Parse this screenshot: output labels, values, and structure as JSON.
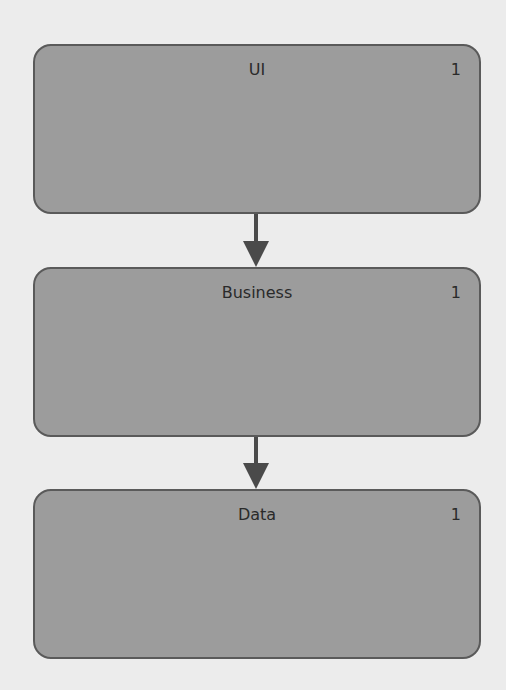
{
  "diagram": {
    "type": "layered-architecture",
    "colors": {
      "background": "#ececec",
      "box_fill": "#9c9c9c",
      "box_border": "#5a5a5a",
      "arrow": "#4a4a4a",
      "text": "#2a2a2a"
    },
    "layers": [
      {
        "title": "UI",
        "count": "1"
      },
      {
        "title": "Business",
        "count": "1"
      },
      {
        "title": "Data",
        "count": "1"
      }
    ],
    "edges": [
      {
        "from": "UI",
        "to": "Business"
      },
      {
        "from": "Business",
        "to": "Data"
      }
    ]
  }
}
